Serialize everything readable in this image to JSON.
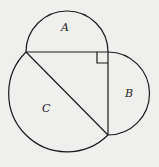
{
  "diagram": {
    "labels": {
      "a": "A",
      "b": "B",
      "c": "C"
    },
    "colors": {
      "stroke": "#1a1a1a",
      "background": "#efefed"
    }
  }
}
